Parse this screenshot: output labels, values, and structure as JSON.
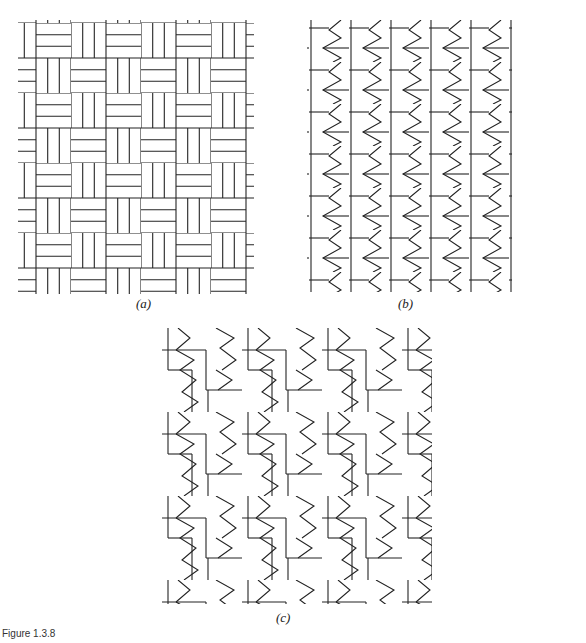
{
  "figure": {
    "caption": "Figure 1.3.8",
    "line_color": "#222222",
    "background": "#ffffff"
  },
  "panels": [
    {
      "id": "a",
      "label": "(a)",
      "description": "basketweave tiling of rectangles in 3-stripe squares"
    },
    {
      "id": "b",
      "label": "(b)",
      "description": "zigzag tiling arranged in vertical columns"
    },
    {
      "id": "c",
      "label": "(c)",
      "description": "offset zigzag tiling with staggered columns"
    }
  ]
}
